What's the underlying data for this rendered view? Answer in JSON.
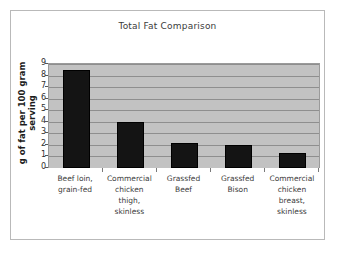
{
  "chart_data": {
    "type": "bar",
    "title": "Total Fat Comparison",
    "xlabel": "",
    "ylabel": "g of fat per 100 gram serving",
    "categories": [
      "Beef loin, grain-fed",
      "Commercial chicken thigh, skinless",
      "Grassfed Beef",
      "Grassfed Bison",
      "Commercial chicken breast, skinless"
    ],
    "values": [
      8.5,
      4.0,
      2.2,
      2.0,
      1.3
    ],
    "ylim": [
      0,
      9
    ],
    "yticks": [
      9,
      8,
      7,
      6,
      5,
      4,
      3,
      2,
      1,
      0
    ],
    "grid": true,
    "legend": "none",
    "bar_color": "#141414",
    "plot_background": "#c2c2c2",
    "gridline_color": "#8e8e8e"
  }
}
